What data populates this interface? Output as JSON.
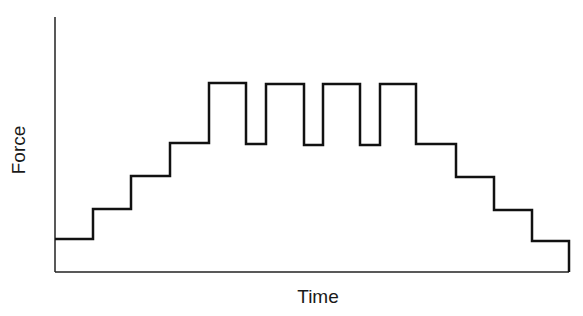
{
  "chart_data": {
    "type": "line",
    "subtype": "step",
    "title": "",
    "xlabel": "Time",
    "ylabel": "Force",
    "grid": false,
    "legend": null,
    "x_ticks": [],
    "y_ticks": [],
    "step_levels_description": "Stepwise increase in 4 levels, then alternating between peak and level 4 (4 peaks, 3 dips), then stepwise decrease in 4 levels",
    "x": [
      0,
      1,
      2,
      3,
      4,
      5,
      6,
      7,
      8,
      9,
      10,
      11,
      12,
      13,
      14
    ],
    "values": [
      1,
      2,
      3,
      4,
      6,
      4,
      6,
      4,
      6,
      4,
      6,
      4,
      3,
      2,
      1
    ],
    "ylim": [
      0,
      7
    ]
  },
  "style": {
    "line_color": "#111111",
    "axis_color": "#222222"
  },
  "geometry": {
    "axis": {
      "x0": 55,
      "y0": 272,
      "ytop": 17,
      "xend": 569
    },
    "path": "M55,239 L93,239 L93,209 L131,209 L131,176 L170,176 L170,143 L209,143 L209,83 L246,83 L246,144 L266,144 L266,84 L304,84 L304,145 L323,145 L323,84 L360,84 L360,145 L380,145 L380,84 L416,84 L416,144 L456,144 L456,177 L494,177 L494,210 L532,210 L532,241 L569,241 L569,272"
  }
}
